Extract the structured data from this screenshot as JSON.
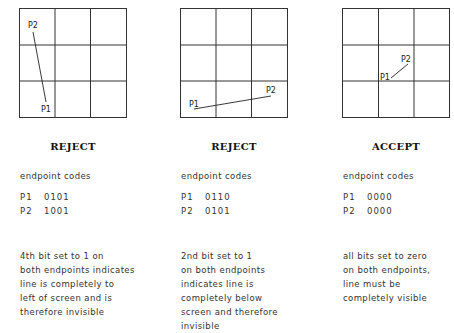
{
  "figure": "Cohen-Sutherland trivial accept/reject endpoint codes",
  "panels": [
    {
      "id": "left-reject",
      "verdict": "REJECT",
      "codes_title": "endpoint codes",
      "codes": [
        {
          "point": "P1",
          "code": "0101"
        },
        {
          "point": "P2",
          "code": "1001"
        }
      ],
      "description": "4th bit set to 1 on\nboth endpoints indicates\nline is completely to\nleft of screen and is\ntherefore invisible",
      "line": {
        "p1_label": "P1",
        "p2_label": "P2"
      }
    },
    {
      "id": "below-reject",
      "verdict": "REJECT",
      "codes_title": "endpoint codes",
      "codes": [
        {
          "point": "P1",
          "code": "0110"
        },
        {
          "point": "P2",
          "code": "0101"
        }
      ],
      "description": "2nd bit set to 1\non both endpoints\nindicates line is\ncompletely below\nscreen and therefore\ninvisible",
      "line": {
        "p1_label": "P1",
        "p2_label": "P2"
      }
    },
    {
      "id": "inside-accept",
      "verdict": "ACCEPT",
      "codes_title": "endpoint codes",
      "codes": [
        {
          "point": "P1",
          "code": "0000"
        },
        {
          "point": "P2",
          "code": "0000"
        }
      ],
      "description": "all bits set to zero\non both endpoints,\nline must be\ncompletely visible",
      "line": {
        "p1_label": "P1",
        "p2_label": "P2"
      }
    }
  ]
}
